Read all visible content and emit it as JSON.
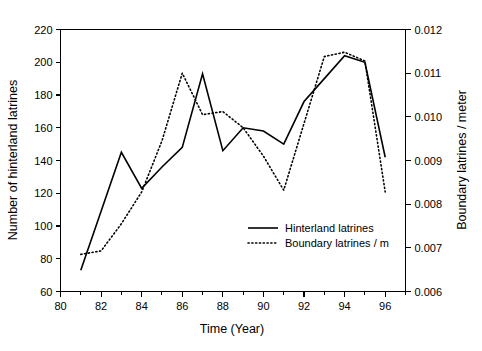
{
  "chart_data": {
    "type": "line",
    "title": "",
    "xlabel": "Time (Year)",
    "ylabel": "Number of hinterland latrines",
    "y2label": "Boundary latrines / meter",
    "xlim": [
      80,
      97
    ],
    "ylim": [
      60,
      220
    ],
    "y2lim": [
      0.006,
      0.012
    ],
    "grid": false,
    "legend_position": "inside-lower-right",
    "x_ticklabels": [
      "80",
      "82",
      "84",
      "86",
      "88",
      "90",
      "92",
      "94",
      "96"
    ],
    "x_tickvalues": [
      80,
      82,
      84,
      86,
      88,
      90,
      92,
      94,
      96
    ],
    "x_minor_tickvalues": [
      81,
      83,
      85,
      87,
      89,
      91,
      93,
      95,
      97
    ],
    "y_ticklabels": [
      "60",
      "80",
      "100",
      "120",
      "140",
      "160",
      "180",
      "200",
      "220"
    ],
    "y_tickvalues": [
      60,
      80,
      100,
      120,
      140,
      160,
      180,
      200,
      220
    ],
    "y2_ticklabels": [
      "0.006",
      "0.007",
      "0.008",
      "0.009",
      "0.010",
      "0.011",
      "0.012"
    ],
    "y2_tickvalues": [
      0.006,
      0.007,
      0.008,
      0.009,
      0.01,
      0.011,
      0.012
    ],
    "x": [
      81,
      82,
      83,
      84,
      85,
      86,
      87,
      88,
      89,
      90,
      91,
      92,
      93,
      94,
      95,
      96
    ],
    "series": [
      {
        "name": "Hinterland latrines",
        "axis": "left",
        "style": "solid",
        "color": "#000000",
        "values": [
          73,
          109,
          145,
          123,
          136,
          148,
          193,
          146,
          160,
          158,
          150,
          176,
          190,
          204,
          200,
          142
        ]
      },
      {
        "name": "Boundary latrines / m",
        "axis": "right",
        "style": "dotted",
        "color": "#000000",
        "values": [
          0.00685,
          0.00693,
          0.00755,
          0.00828,
          0.00945,
          0.011,
          0.01005,
          0.01012,
          0.00975,
          0.0091,
          0.00832,
          0.00985,
          0.01138,
          0.01148,
          0.01128,
          0.00828
        ]
      }
    ]
  },
  "legend": {
    "entries": [
      {
        "label": "Hinterland latrines",
        "style": "solid"
      },
      {
        "label": "Boundary latrines / m",
        "style": "dotted"
      }
    ]
  }
}
